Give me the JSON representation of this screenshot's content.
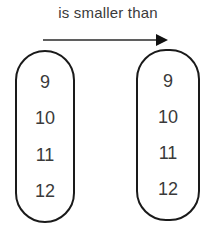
{
  "relation": {
    "label": "is smaller than",
    "arrow_direction": "left-to-right"
  },
  "sets": {
    "left": {
      "items": [
        "9",
        "10",
        "11",
        "12"
      ]
    },
    "right": {
      "items": [
        "9",
        "10",
        "11",
        "12"
      ]
    }
  }
}
